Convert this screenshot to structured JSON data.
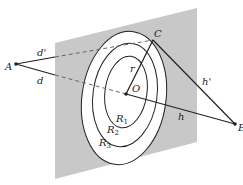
{
  "figure": {
    "type": "Fresnel zone diagram",
    "labels": {
      "A": "A",
      "B": "B",
      "C": "C",
      "O": "O",
      "d": "d",
      "d_prime": "d'",
      "h": "h",
      "h_prime": "h'",
      "r": "r",
      "R1": "R",
      "R2": "R",
      "R3": "R",
      "sub1": "1",
      "sub2": "2",
      "sub3": "3"
    },
    "colors": {
      "plane": "#c8c8c8",
      "zone": "#ffffff",
      "line": "#222222"
    }
  }
}
